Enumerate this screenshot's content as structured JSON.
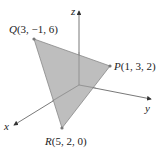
{
  "diagram": {
    "type": "3d-triangle-in-coordinate-axes",
    "axes": {
      "x": {
        "label": "x"
      },
      "y": {
        "label": "y"
      },
      "z": {
        "label": "z"
      }
    },
    "points": [
      {
        "name": "Q",
        "coords": "(3, −1, 6)"
      },
      {
        "name": "P",
        "coords": "(1, 3, 2)"
      },
      {
        "name": "R",
        "coords": "(5, 2, 0)"
      }
    ],
    "fill_color": "#b8b8b8",
    "axis_color": "#555555"
  }
}
